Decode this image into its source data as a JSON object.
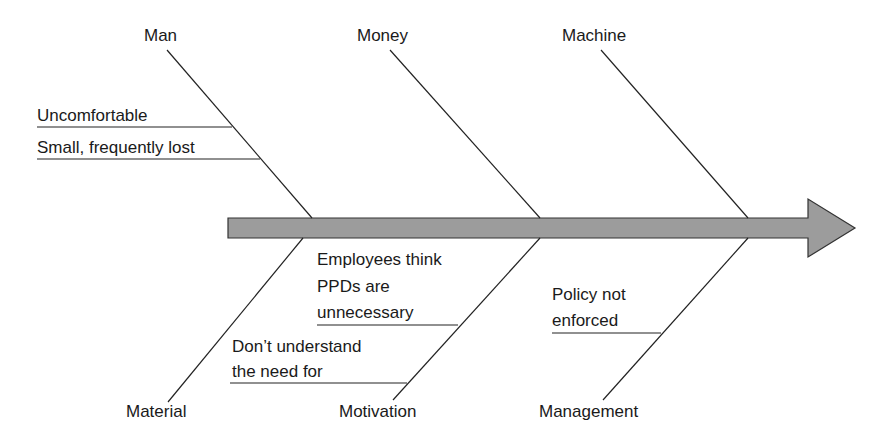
{
  "diagram": {
    "type": "fishbone",
    "colors": {
      "line": "#222222",
      "arrow_fill": "#9a9a9a",
      "arrow_stroke": "#333333",
      "background": "#ffffff"
    },
    "categories": {
      "top": [
        {
          "label": "Man",
          "causes": [
            "Uncomfortable",
            "Small, frequently lost"
          ]
        },
        {
          "label": "Money",
          "causes": []
        },
        {
          "label": "Machine",
          "causes": []
        }
      ],
      "bottom": [
        {
          "label": "Material",
          "causes": []
        },
        {
          "label": "Motivation",
          "causes": [
            "Employees think PPDs are unnecessary",
            "Don’t understand the need for"
          ]
        },
        {
          "label": "Management",
          "causes": [
            "Policy not enforced"
          ]
        }
      ]
    },
    "text": {
      "man": "Man",
      "money": "Money",
      "machine": "Machine",
      "material": "Material",
      "motivation": "Motivation",
      "management": "Management",
      "uncomfortable": "Uncomfortable",
      "small_lost": "Small, frequently lost",
      "employees_l1": "Employees think",
      "employees_l2": "PPDs are",
      "employees_l3": "unnecessary",
      "dont_l1": "Don’t understand",
      "dont_l2": "the need for",
      "policy_l1": "Policy not",
      "policy_l2": "enforced"
    }
  }
}
